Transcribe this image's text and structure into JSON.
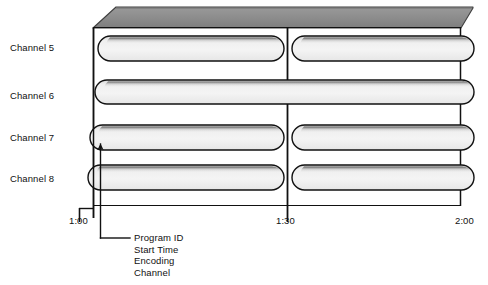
{
  "figure": {
    "type": "timeline-grid-3d"
  },
  "channels": {
    "axis_label": "Channel",
    "items": [
      {
        "label": "Channel 5",
        "y": 48
      },
      {
        "label": "Channel 6",
        "y": 96
      },
      {
        "label": "Channel 7",
        "y": 139
      },
      {
        "label": "Channel 8",
        "y": 180
      }
    ]
  },
  "time_axis": {
    "ticks": [
      {
        "label": "1:00",
        "x": 93
      },
      {
        "label": "1:30",
        "x": 287
      },
      {
        "label": "2:00",
        "x": 466
      }
    ]
  },
  "programs": [
    {
      "channel": "Channel 5",
      "row": 0,
      "segment": "left",
      "start": "1:00",
      "end": "1:30"
    },
    {
      "channel": "Channel 5",
      "row": 0,
      "segment": "right",
      "start": "1:30",
      "end": "2:00"
    },
    {
      "channel": "Channel 6",
      "row": 1,
      "segment": "full",
      "start": "1:00",
      "end": "2:00"
    },
    {
      "channel": "Channel 7",
      "row": 2,
      "segment": "left",
      "start": "1:00",
      "end": "1:30"
    },
    {
      "channel": "Channel 7",
      "row": 2,
      "segment": "right",
      "start": "1:30",
      "end": "2:00"
    },
    {
      "channel": "Channel 8",
      "row": 3,
      "segment": "left",
      "start": "1:00",
      "end": "1:30"
    },
    {
      "channel": "Channel 8",
      "row": 3,
      "segment": "right",
      "start": "1:30",
      "end": "2:00"
    }
  ],
  "callout": {
    "target": "Channel 7 program block starting at 1:00",
    "lines": [
      "Program ID",
      "Start Time",
      "Encoding",
      "Channel"
    ]
  },
  "colors": {
    "outline": "#111111",
    "top_face": "#8c8c8c",
    "top_face_edge": "#5a5a5a",
    "pill_fill_light": "#f2f2f2",
    "pill_fill_mid": "#e2e2e2",
    "pill_top_shadow": "#4a4a4a",
    "text": "#111111",
    "background": "#ffffff"
  }
}
